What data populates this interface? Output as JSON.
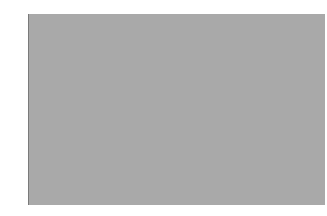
{
  "chart_data": {
    "type": "box",
    "title": "",
    "xlabel": "",
    "ylabel": "",
    "ylim": [
      3490,
      123490
    ],
    "yticks": [
      3490,
      23490,
      43490,
      63490,
      83490,
      103490,
      123490
    ],
    "ytick_labels": [
      "3490",
      "23490",
      "43490",
      "63490",
      "83490",
      "103490",
      "123490"
    ],
    "x_tick_label": "90600",
    "grid": false,
    "series": [
      {
        "name": "box",
        "whisker_low": 3490,
        "q1": 30900,
        "median": 64900,
        "q3": 87900,
        "whisker_high": 123490
      }
    ],
    "colors": {
      "plot_background": "#a9a9a9",
      "box_line": "#1a1a1a"
    }
  }
}
